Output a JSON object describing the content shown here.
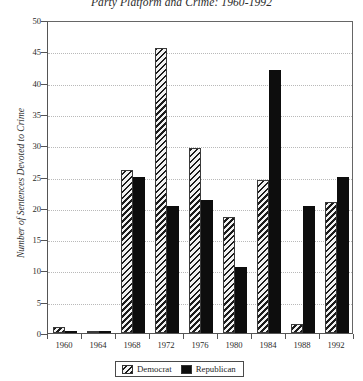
{
  "chart_data": {
    "type": "bar",
    "title": "Party Platform and Crime: 1960-1992",
    "xlabel": "",
    "ylabel": "Number of Sentences Devoted to Crime",
    "categories": [
      "1960",
      "1964",
      "1968",
      "1972",
      "1976",
      "1980",
      "1984",
      "1988",
      "1992"
    ],
    "series": [
      {
        "name": "Democrat",
        "color": "#d8d8d8",
        "pattern": "diagonal-hatch",
        "values": [
          1.0,
          0.2,
          26.0,
          45.5,
          29.6,
          18.5,
          24.5,
          1.5,
          21.0
        ]
      },
      {
        "name": "Republican",
        "color": "#0d0d0d",
        "pattern": "solid",
        "values": [
          0.2,
          0.2,
          25.0,
          20.3,
          21.2,
          10.6,
          42.0,
          20.3,
          25.0
        ]
      }
    ],
    "ylim": [
      0,
      50
    ],
    "yticks": [
      0,
      5,
      10,
      15,
      20,
      25,
      30,
      35,
      40,
      45,
      50
    ],
    "grid": true,
    "grid_style": "dotted-horizontal",
    "legend_position": "bottom-center"
  },
  "legend": {
    "entries": [
      {
        "label": "Democrat",
        "swatch": "hatched-swatch"
      },
      {
        "label": "Republican",
        "swatch": "solid-black-swatch"
      }
    ]
  }
}
